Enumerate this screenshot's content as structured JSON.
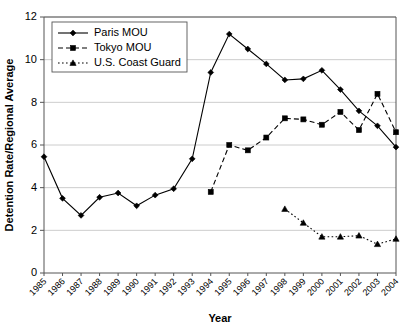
{
  "chart_data": {
    "type": "line",
    "title": "",
    "xlabel": "Year",
    "ylabel": "Detention Rate/Regional Average",
    "x": [
      1985,
      1986,
      1987,
      1988,
      1989,
      1990,
      1991,
      1992,
      1993,
      1994,
      1995,
      1996,
      1997,
      1998,
      1999,
      2000,
      2001,
      2002,
      2003,
      2004
    ],
    "xtick_labels": [
      "1985",
      "1986",
      "1987",
      "1988",
      "1989",
      "1990",
      "1991",
      "1992",
      "1993",
      "1994",
      "1995",
      "1996",
      "1997",
      "1998",
      "1999",
      "2000",
      "2001",
      "2002",
      "2003",
      "2004"
    ],
    "ytick_labels": [
      "0",
      "2",
      "4",
      "6",
      "8",
      "10",
      "12"
    ],
    "ytick_values": [
      0,
      2,
      4,
      6,
      8,
      10,
      12
    ],
    "ylim": [
      0,
      12
    ],
    "xlim": [
      1985,
      2004
    ],
    "grid": "horizontal",
    "legend_position": "top-left",
    "series": [
      {
        "name": "Paris MOU",
        "marker": "diamond",
        "line_style": "solid",
        "x": [
          1985,
          1986,
          1987,
          1988,
          1989,
          1990,
          1991,
          1992,
          1993,
          1994,
          1995,
          1996,
          1997,
          1998,
          1999,
          2000,
          2001,
          2002,
          2003,
          2004
        ],
        "values": [
          5.45,
          3.5,
          2.7,
          3.55,
          3.75,
          3.15,
          3.65,
          3.95,
          5.35,
          9.4,
          11.2,
          10.5,
          9.8,
          9.05,
          9.1,
          9.5,
          8.6,
          7.6,
          6.9,
          5.9
        ]
      },
      {
        "name": "Tokyo MOU",
        "marker": "square",
        "line_style": "dashed",
        "x": [
          1994,
          1995,
          1996,
          1997,
          1998,
          1999,
          2000,
          2001,
          2002,
          2003,
          2004
        ],
        "values": [
          3.8,
          6.0,
          5.75,
          6.35,
          7.25,
          7.2,
          6.95,
          7.55,
          6.7,
          8.4,
          6.6
        ]
      },
      {
        "name": "U.S. Coast Guard",
        "marker": "triangle",
        "line_style": "dotted",
        "x": [
          1998,
          1999,
          2000,
          2001,
          2002,
          2003,
          2004
        ],
        "values": [
          3.0,
          2.35,
          1.7,
          1.7,
          1.75,
          1.35,
          1.6
        ]
      }
    ]
  }
}
